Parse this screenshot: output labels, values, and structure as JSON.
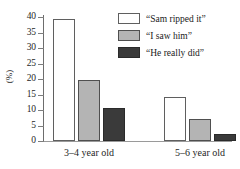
{
  "chart_data": {
    "type": "bar",
    "title": "",
    "xlabel": "",
    "ylabel": "(%)",
    "ylim": [
      0,
      40
    ],
    "yticks": [
      0,
      5,
      10,
      15,
      20,
      25,
      30,
      35,
      40
    ],
    "ytick_labels": [
      "0",
      "5",
      "10",
      "15",
      "20",
      "25",
      "30",
      "35",
      "40"
    ],
    "grid": false,
    "legend_position": "top-right",
    "categories": [
      "3–4 year old",
      "5–6 year old"
    ],
    "series": [
      {
        "name": "“Sam ripped it”",
        "color": "#ffffff",
        "values": [
          39.5,
          14.2
        ]
      },
      {
        "name": "“I saw him”",
        "color": "#b4b4b4",
        "values": [
          19.8,
          7.1
        ]
      },
      {
        "name": "“He really did”",
        "color": "#3a3a3a",
        "values": [
          10.5,
          2.3
        ]
      }
    ]
  },
  "legend": {
    "items": [
      {
        "label": "“Sam ripped it”",
        "swatch": "white-swatch"
      },
      {
        "label": "“I saw him”",
        "swatch": "gray-swatch"
      },
      {
        "label": "“He really did”",
        "swatch": "dark-swatch"
      }
    ]
  },
  "axis": {
    "y_title": "(%)",
    "y_tick_labels": [
      "40",
      "35",
      "30",
      "25",
      "20",
      "15",
      "10",
      "5",
      "0"
    ],
    "x_group_labels": [
      "3–4 year old",
      "5–6 year old"
    ]
  },
  "colors": {
    "series_0": "#ffffff",
    "series_1": "#b4b4b4",
    "series_2": "#3a3a3a",
    "axis": "#6d6d6d",
    "text": "#1a1a1a"
  }
}
